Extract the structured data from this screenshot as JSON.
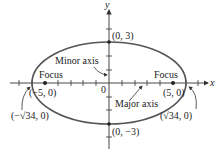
{
  "figure": {
    "type": "ellipse",
    "equation_hint": "x^2/34 + y^2/9 = 1",
    "axes": {
      "x_label": "x",
      "y_label": "y",
      "origin_label": "0"
    },
    "labels": {
      "top_vertex": "(0, 3)",
      "bottom_vertex": "(0, −3)",
      "left_focus_name": "Focus",
      "right_focus_name": "Focus",
      "left_focus_coord": "(−5, 0)",
      "right_focus_coord": "(5, 0)",
      "left_vertex": "(−√34, 0)",
      "right_vertex": "(√34, 0)",
      "minor_axis": "Minor axis",
      "major_axis": "Major axis"
    },
    "colors": {
      "ellipse": "#555555",
      "axes": "#333333",
      "text": "#222222"
    }
  }
}
